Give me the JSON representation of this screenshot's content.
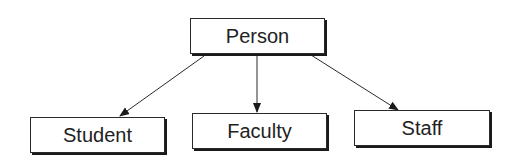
{
  "diagram": {
    "type": "class-hierarchy",
    "nodes": [
      {
        "id": "person",
        "label": "Person"
      },
      {
        "id": "student",
        "label": "Student"
      },
      {
        "id": "faculty",
        "label": "Faculty"
      },
      {
        "id": "staff",
        "label": "Staff"
      }
    ],
    "edges": [
      {
        "from": "person",
        "to": "student"
      },
      {
        "from": "person",
        "to": "faculty"
      },
      {
        "from": "person",
        "to": "staff"
      }
    ]
  },
  "colors": {
    "line": "#2a2a2a",
    "background": "#ffffff",
    "text": "#222222"
  }
}
